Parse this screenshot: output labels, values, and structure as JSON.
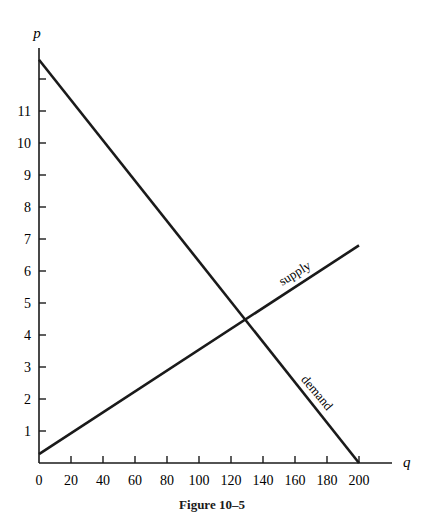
{
  "chart_data": {
    "type": "line",
    "title": "",
    "caption": "Figure 10–5",
    "xlabel": "q",
    "ylabel": "p",
    "xlim": [
      0,
      200
    ],
    "ylim": [
      0,
      12.6
    ],
    "x_ticks": [
      0,
      20,
      40,
      60,
      80,
      100,
      120,
      140,
      160,
      180,
      200
    ],
    "y_ticks": [
      1,
      2,
      3,
      4,
      5,
      6,
      7,
      8,
      9,
      10,
      11,
      12
    ],
    "y_tick_labels": [
      "1",
      "2",
      "3",
      "4",
      "5",
      "6",
      "7",
      "8",
      "9",
      "10",
      "11",
      ""
    ],
    "grid": false,
    "legend": "none",
    "series": [
      {
        "name": "demand",
        "x": [
          0,
          200
        ],
        "y": [
          12.6,
          0
        ],
        "label_rotation": 50
      },
      {
        "name": "supply",
        "x": [
          0,
          200
        ],
        "y": [
          0.28,
          6.8
        ],
        "label_rotation": -32
      }
    ],
    "equilibrium": {
      "q": 130,
      "p": 4.5
    }
  }
}
